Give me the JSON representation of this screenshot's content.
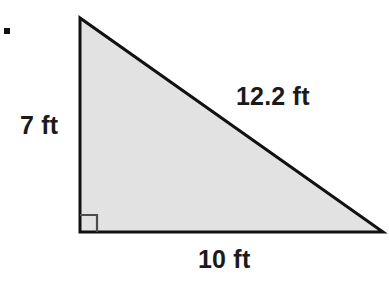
{
  "figure": {
    "kind": "right-triangle-diagram",
    "bullet_marker": "■",
    "background_color": "#ffffff",
    "fill_color": "#e2e2e2",
    "stroke_color": "#111111",
    "stroke_width": 3,
    "right_angle_marker_color": "#4d4d4d"
  },
  "labels": {
    "vertical_leg": "7 ft",
    "hypotenuse": "12.2 ft",
    "horizontal_leg": "10 ft"
  },
  "chart_data": {
    "type": "diagram",
    "shape": "right triangle",
    "title": "",
    "vertices": {
      "apex": [
        80,
        18
      ],
      "bottom_left": [
        80,
        232
      ],
      "bottom_right": [
        383,
        232
      ]
    },
    "sides": [
      {
        "name": "vertical leg",
        "label": "7 ft",
        "value": 7,
        "unit": "ft"
      },
      {
        "name": "horizontal leg",
        "label": "10 ft",
        "value": 10,
        "unit": "ft"
      },
      {
        "name": "hypotenuse",
        "label": "12.2 ft",
        "value": 12.2,
        "unit": "ft"
      }
    ],
    "right_angle_at": "bottom_left",
    "annotations": [
      "7 ft",
      "12.2 ft",
      "10 ft"
    ]
  }
}
